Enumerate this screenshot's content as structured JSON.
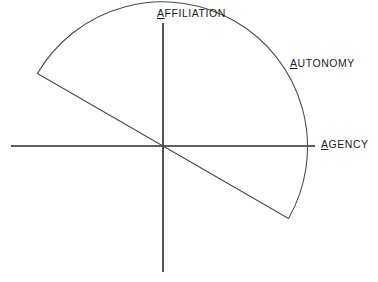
{
  "diagram": {
    "type": "polar-wedge-axes",
    "background_color": "#ffffff",
    "axis_color": "#2b2b2b",
    "wedge_color": "#4a4a4a",
    "origin": {
      "x": 163,
      "y": 146
    },
    "radius": 145,
    "horizontal_axis": {
      "x_start": 11,
      "x_end": 315,
      "y": 146
    },
    "vertical_axis": {
      "y_start": 23,
      "y_end": 272,
      "x": 163
    },
    "wedge": {
      "start_angle_deg": -30,
      "end_angle_deg": 150,
      "sweep_deg": 180,
      "start_point": {
        "x": 288,
        "y": 217
      },
      "end_point": {
        "x": 42,
        "y": 77
      }
    },
    "labels": [
      {
        "name": "affiliation",
        "lead_letter": "A",
        "rest": "FFILIATION",
        "full_text": "AFFILIATION",
        "position": "top",
        "underlined_lead": true
      },
      {
        "name": "autonomy",
        "lead_letter": "A",
        "rest": "UTONOMY",
        "full_text": "AUTONOMY",
        "position": "upper-right",
        "underlined_lead": true
      },
      {
        "name": "agency",
        "lead_letter": "A",
        "rest": "GENCY",
        "full_text": "AGENCY",
        "position": "right",
        "underlined_lead": true
      }
    ]
  }
}
